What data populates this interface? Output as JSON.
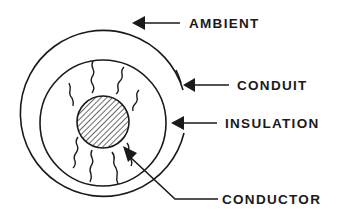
{
  "diagram": {
    "type": "cable cross-section heat flow",
    "labels": {
      "ambient": "AMBIENT",
      "conduit": "CONDUIT",
      "insulation": "INSULATION",
      "conductor": "CONDUCTOR"
    },
    "colors": {
      "stroke": "#1a1a1a",
      "background": "#ffffff"
    }
  }
}
